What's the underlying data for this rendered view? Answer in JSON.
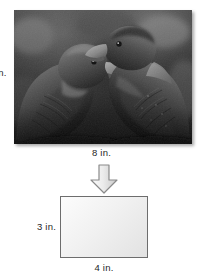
{
  "figure": {
    "type": "scale-drawing-reduction",
    "photo": {
      "alt_name": "two-parrots-photograph",
      "description": "Black and white photograph of two parrots facing each other",
      "height_label": "in.",
      "width_label": "8 in."
    },
    "arrow": {
      "name": "down-arrow-icon",
      "direction": "down"
    },
    "rectangle": {
      "name": "reduced-rectangle",
      "height_label": "3 in.",
      "width_label": "4 in."
    }
  },
  "colors": {
    "rect_border": "#6d6d6d",
    "rect_fill": "#f1f1f1",
    "arrow_fill": "#e3e3e3",
    "arrow_border": "#8a8a8a",
    "text": "#1f1f1f"
  }
}
